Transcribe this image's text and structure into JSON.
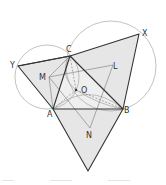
{
  "diagram": {
    "type": "geometry",
    "points": {
      "A": [
        53,
        109
      ],
      "B": [
        123,
        109
      ],
      "C": [
        70,
        56
      ],
      "X": [
        139,
        34
      ],
      "Y": [
        18,
        66
      ],
      "Z": [
        88,
        171
      ],
      "M": [
        49,
        77
      ],
      "L": [
        113,
        65
      ],
      "N": [
        90,
        128
      ],
      "O": [
        76,
        90
      ]
    },
    "labels": [
      {
        "text": "C",
        "x": 66,
        "y": 52
      },
      {
        "text": "X",
        "x": 142,
        "y": 36
      },
      {
        "text": "Y",
        "x": 10,
        "y": 68
      },
      {
        "text": "M",
        "x": 39,
        "y": 80
      },
      {
        "text": "L",
        "x": 113,
        "y": 69
      },
      {
        "text": "O",
        "x": 81,
        "y": 93
      },
      {
        "text": "A",
        "x": 47,
        "y": 117
      },
      {
        "text": "B",
        "x": 124,
        "y": 113
      },
      {
        "text": "N",
        "x": 86,
        "y": 138
      }
    ],
    "colors": {
      "fill": "#e6e6e6",
      "stroke": "#333333",
      "thin": "#777777",
      "circle": "#999999"
    }
  }
}
